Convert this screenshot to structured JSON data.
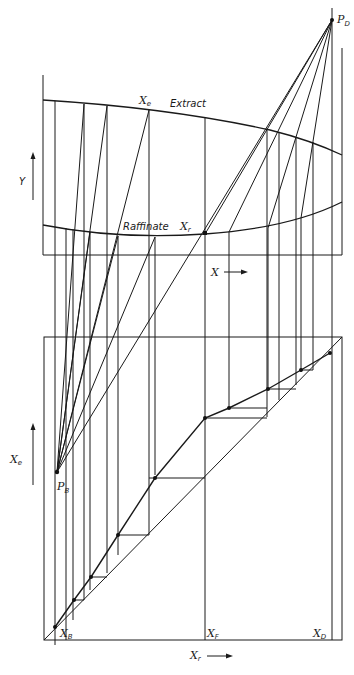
{
  "diagram": {
    "upper": {
      "frame": {
        "x1": 43,
        "x2": 342,
        "top": 75,
        "bottom": 255
      },
      "extract_curve_label": "Extract",
      "raffinate_curve_label": "Raffinate",
      "y_axis_label": "Y",
      "x_axis_label": "X",
      "xe_label": "X",
      "xe_sub": "e",
      "xr_label": "X",
      "xr_sub": "r",
      "pd_label": "P",
      "pd_sub": "D"
    },
    "lower": {
      "frame": {
        "x1": 44,
        "x2": 342,
        "top": 337,
        "bottom": 640
      },
      "y_axis_label": "X",
      "y_axis_sub": "e",
      "x_axis_label": "X",
      "x_axis_sub": "r",
      "xb_label": "X",
      "xb_sub": "B",
      "xf_label": "X",
      "xf_sub": "F",
      "xd_label": "X",
      "xd_sub": "D",
      "pb_label": "P",
      "pb_sub": "B"
    },
    "colors": {
      "ink": "#1a1a1a",
      "background": "#ffffff"
    }
  }
}
